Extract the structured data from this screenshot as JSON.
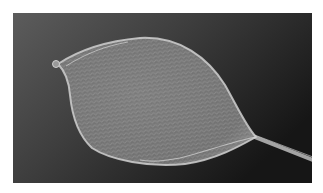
{
  "image": {
    "subject": "leaf-shaped mesh filter basket on a wire stem",
    "alt": "Grayscale photograph of an oval mesh net basket attached to a thin wire stem against a dark background",
    "colors": {
      "border": "#ffffff",
      "background_light": "#5c5c5c",
      "background_dark": "#161616",
      "mesh_fill": "#7c7c7c",
      "mesh_strand": "#a8a8a8",
      "rim": "#cfcfcf",
      "stem": "#bdbdbd"
    }
  }
}
